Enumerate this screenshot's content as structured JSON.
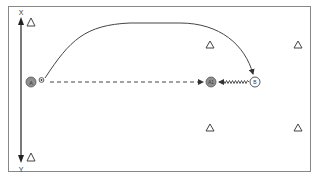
{
  "diagram": {
    "type": "soccer-drill",
    "colors": {
      "line": "#444444",
      "border": "#777777",
      "player_fill": "#8a8a8a",
      "player_b_fill": "#ffffff",
      "cone": "#555555"
    },
    "axis": {
      "top_label": "X",
      "bottom_label": "Y"
    },
    "players": [
      {
        "id": "A",
        "label": "A",
        "role": "passer",
        "style": "gray"
      },
      {
        "id": "A1",
        "label": "A1",
        "role": "receiver",
        "style": "gray"
      },
      {
        "id": "B",
        "label": "B",
        "role": "defender",
        "style": "white"
      }
    ],
    "ball": {
      "icon": "soccer-ball-icon"
    },
    "cones": [
      {
        "id": "cone-1",
        "icon": "cone-icon"
      },
      {
        "id": "cone-2",
        "icon": "cone-icon"
      },
      {
        "id": "cone-3",
        "icon": "cone-icon"
      },
      {
        "id": "cone-4",
        "icon": "cone-icon"
      },
      {
        "id": "cone-5",
        "icon": "cone-icon"
      },
      {
        "id": "cone-6",
        "icon": "cone-icon"
      }
    ],
    "paths": [
      {
        "id": "pass",
        "style": "dashed-arrow",
        "from": "A",
        "to": "A1"
      },
      {
        "id": "run",
        "style": "curved-arrow",
        "from": "A",
        "to": "B"
      },
      {
        "id": "dribble",
        "style": "zigzag-arrow",
        "from": "B",
        "to": "A1"
      }
    ]
  }
}
